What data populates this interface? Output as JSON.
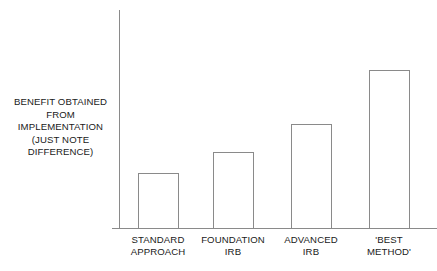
{
  "chart_data": {
    "type": "bar",
    "title": "",
    "subtitle": "",
    "xlabel": "",
    "ylabel": "BENEFIT OBTAINED FROM IMPLEMENTATION (JUST NOTE DIFFERENCE)",
    "categories": [
      "STANDARD APPROACH",
      "FOUNDATION IRB",
      "ADVANCED IRB",
      "'BEST METHOD'"
    ],
    "values": [
      25,
      35,
      48,
      72
    ],
    "ylim": [
      0,
      100
    ],
    "grid": false,
    "legend": null,
    "annotations": [],
    "bar_style": "outline-only, no fill",
    "axis_color": "#8a8a8a",
    "bar_outline_color": "#8a8a8a",
    "background_color": "#ffffff",
    "text_color": "#1a1a1a",
    "y_axis_ticks": [],
    "x_axis_ticks": []
  },
  "y_axis_caption": {
    "lines": [
      "BENEFIT OBTAINED",
      "FROM",
      "IMPLEMENTATION",
      "(JUST NOTE",
      "DIFFERENCE)"
    ]
  },
  "category_labels": [
    {
      "line1": "STANDARD",
      "line2": "APPROACH"
    },
    {
      "line1": "FOUNDATION",
      "line2": "IRB"
    },
    {
      "line1": "ADVANCED",
      "line2": "IRB"
    },
    {
      "line1": "'BEST",
      "line2": "METHOD'"
    }
  ],
  "geometry": {
    "baseline_y": 228,
    "axis_x": 119,
    "axis_top_y": 10,
    "axis_right_x": 437,
    "bars": [
      {
        "left": 138,
        "width": 41,
        "top": 173
      },
      {
        "left": 213,
        "width": 41,
        "top": 152
      },
      {
        "left": 291,
        "width": 41,
        "top": 124
      },
      {
        "left": 369,
        "width": 41,
        "top": 70
      }
    ],
    "label_centers": [
      158,
      233,
      311,
      389
    ],
    "label_top": 234
  }
}
